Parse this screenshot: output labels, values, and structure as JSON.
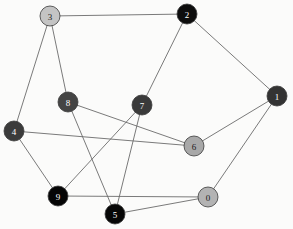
{
  "figure": {
    "type": "node-link-graph",
    "background_color": "#fbfbfa",
    "width": 293,
    "height": 229,
    "node_radius": 10,
    "edge_color": "#6b6b6b",
    "node_border_color": "#3a3a3a"
  },
  "graph_data": {
    "type": "graph",
    "directed": false,
    "node_count": 10,
    "edge_count": 15,
    "nodes": [
      {
        "id": "0",
        "label": "0",
        "x": 208,
        "y": 197,
        "fill": "#b3b3b3",
        "text_color": "#1a1a1a",
        "degree": 3
      },
      {
        "id": "1",
        "label": "1",
        "x": 277,
        "y": 96,
        "fill": "#333333",
        "text_color": "#ffffff",
        "degree": 3
      },
      {
        "id": "2",
        "label": "2",
        "x": 187,
        "y": 14,
        "fill": "#0d0d0d",
        "text_color": "#ffffff",
        "degree": 3
      },
      {
        "id": "3",
        "label": "3",
        "x": 50,
        "y": 16,
        "fill": "#c4c4c4",
        "text_color": "#1a1a1a",
        "degree": 3
      },
      {
        "id": "4",
        "label": "4",
        "x": 14,
        "y": 131,
        "fill": "#3b3b3b",
        "text_color": "#ffffff",
        "degree": 3
      },
      {
        "id": "5",
        "label": "5",
        "x": 115,
        "y": 214,
        "fill": "#070707",
        "text_color": "#ffffff",
        "degree": 3
      },
      {
        "id": "6",
        "label": "6",
        "x": 194,
        "y": 146,
        "fill": "#a8a8a8",
        "text_color": "#1a1a1a",
        "degree": 3
      },
      {
        "id": "7",
        "label": "7",
        "x": 142,
        "y": 105,
        "fill": "#3a3a3a",
        "text_color": "#ffffff",
        "degree": 3
      },
      {
        "id": "8",
        "label": "8",
        "x": 68,
        "y": 102,
        "fill": "#444444",
        "text_color": "#ffffff",
        "degree": 3
      },
      {
        "id": "9",
        "label": "9",
        "x": 58,
        "y": 196,
        "fill": "#050505",
        "text_color": "#ffffff",
        "degree": 3
      }
    ],
    "edges": [
      {
        "source": "3",
        "target": "2"
      },
      {
        "source": "3",
        "target": "4"
      },
      {
        "source": "3",
        "target": "8"
      },
      {
        "source": "2",
        "target": "7"
      },
      {
        "source": "2",
        "target": "1"
      },
      {
        "source": "1",
        "target": "6"
      },
      {
        "source": "1",
        "target": "0"
      },
      {
        "source": "8",
        "target": "6"
      },
      {
        "source": "8",
        "target": "5"
      },
      {
        "source": "4",
        "target": "9"
      },
      {
        "source": "4",
        "target": "6"
      },
      {
        "source": "7",
        "target": "9"
      },
      {
        "source": "7",
        "target": "5"
      },
      {
        "source": "9",
        "target": "0"
      },
      {
        "source": "5",
        "target": "0"
      }
    ]
  }
}
